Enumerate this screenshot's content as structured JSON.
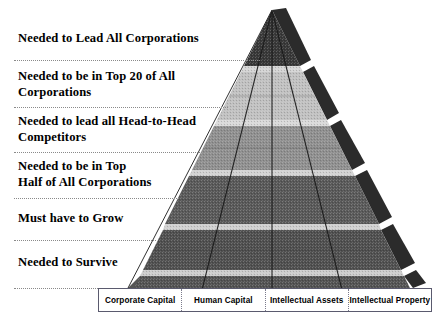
{
  "diagram": {
    "type": "layered-pyramid",
    "title": "",
    "tiers": [
      {
        "index": 1,
        "label": "Needed to Lead All Corporations",
        "fill": "#3a3a3a"
      },
      {
        "index": 2,
        "label": "Needed to be in Top 20 of All\nCorporations",
        "fill": "#c2c2c2"
      },
      {
        "index": 3,
        "label": "Needed to lead all Head-to-Head\nCompetitors",
        "fill": "#8f8f8f"
      },
      {
        "index": 4,
        "label": "Needed to be in Top\nHalf of All Corporations",
        "fill": "#5c5c5c"
      },
      {
        "index": 5,
        "label": "Must have to Grow",
        "fill": "#4f4f4f"
      },
      {
        "index": 6,
        "label": "Needed to Survive",
        "fill": "#565656"
      }
    ],
    "columns": [
      {
        "index": 1,
        "label": "Corporate Capital"
      },
      {
        "index": 2,
        "label": "Human Capital"
      },
      {
        "index": 3,
        "label": "Intellectual Assets"
      },
      {
        "index": 4,
        "label": "Intellectual Property"
      }
    ],
    "colors": {
      "background": "#ffffff",
      "text": "#000000",
      "separator_rule": "#8a8a8a",
      "box_border": "#5a5a6e",
      "side_face_dark": "#2e2e2e",
      "tier_gap_light": "#d9d9d9",
      "grid_line": "#1d1d1d"
    }
  }
}
